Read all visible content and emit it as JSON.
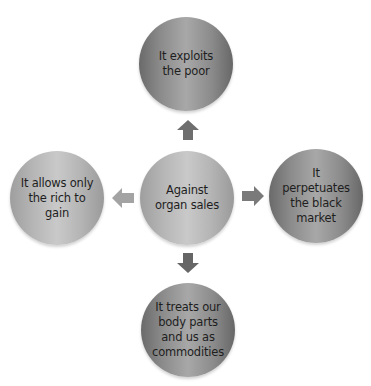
{
  "diagram": {
    "type": "radial",
    "center": {
      "label": "Against organ sales"
    },
    "nodes": [
      {
        "position": "top",
        "label": "It exploits the poor"
      },
      {
        "position": "right",
        "label": "It perpetuates the black market"
      },
      {
        "position": "bottom",
        "label": "It treats our body parts and us as commodities"
      },
      {
        "position": "left",
        "label": "It allows only the rich to gain"
      }
    ],
    "arrows": [
      {
        "direction": "up",
        "icon": "arrow-up-icon"
      },
      {
        "direction": "right",
        "icon": "arrow-right-icon"
      },
      {
        "direction": "down",
        "icon": "arrow-down-icon"
      },
      {
        "direction": "left",
        "icon": "arrow-left-icon"
      }
    ],
    "colors": {
      "dark_node": "#8a8a8a",
      "light_node": "#b6b6b6",
      "arrow_dark": "#6e6e6e",
      "arrow_light": "#a0a0a0",
      "text": "#1e1e1e"
    }
  }
}
